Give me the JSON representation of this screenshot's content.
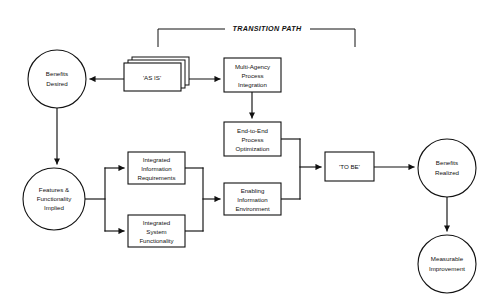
{
  "diagram": {
    "bracket": {
      "label": "TRANSITION PATH",
      "name": "transition-path-bracket"
    },
    "colors": {
      "stroke": "#111111",
      "fill": "#ffffff",
      "background": "#ffffff"
    },
    "nodes": [
      {
        "id": "benefits-desired",
        "shape": "circle",
        "lines": [
          "Benefits",
          "Desired"
        ],
        "cx": 57,
        "cy": 79,
        "r": 29
      },
      {
        "id": "as-is",
        "shape": "stacked-rectangle",
        "lines": [
          "'AS IS'"
        ],
        "x": 124,
        "y": 63,
        "w": 57,
        "h": 28
      },
      {
        "id": "multi-agency-process-integration",
        "shape": "rectangle",
        "lines": [
          "Multi-Agency",
          "Process",
          "Integration"
        ],
        "x": 224,
        "y": 58,
        "w": 57,
        "h": 34
      },
      {
        "id": "end-to-end-process-optimization",
        "shape": "rectangle",
        "lines": [
          "End-to-End",
          "Process",
          "Optimization"
        ],
        "x": 224,
        "y": 122,
        "w": 57,
        "h": 34
      },
      {
        "id": "features-functionality-implied",
        "shape": "circle",
        "lines": [
          "Features &",
          "Functionality",
          "Implied"
        ],
        "cx": 54,
        "cy": 199,
        "r": 31
      },
      {
        "id": "integrated-information-requirements",
        "shape": "rectangle",
        "lines": [
          "Integrated",
          "Information",
          "Requirements"
        ],
        "x": 128,
        "y": 152,
        "w": 57,
        "h": 32
      },
      {
        "id": "integrated-system-functionality",
        "shape": "rectangle",
        "lines": [
          "Integrated",
          "System",
          "Functionality"
        ],
        "x": 128,
        "y": 215,
        "w": 57,
        "h": 32
      },
      {
        "id": "enabling-information-environment",
        "shape": "rectangle",
        "lines": [
          "Enabling",
          "Information",
          "Environment"
        ],
        "x": 224,
        "y": 183,
        "w": 57,
        "h": 32
      },
      {
        "id": "to-be",
        "shape": "rectangle",
        "lines": [
          "'TO BE'"
        ],
        "x": 325,
        "y": 152,
        "w": 49,
        "h": 29
      },
      {
        "id": "benefits-realized",
        "shape": "circle",
        "lines": [
          "Benefits",
          "Realized"
        ],
        "cx": 447,
        "cy": 168,
        "r": 29
      },
      {
        "id": "measurable-improvement",
        "shape": "circle",
        "lines": [
          "Measurable",
          "Improvement"
        ],
        "cx": 447,
        "cy": 264,
        "r": 29
      }
    ],
    "edges": [
      {
        "id": "as-is-to-benefits-desired",
        "from": "as-is",
        "to": "benefits-desired",
        "arrow": true
      },
      {
        "id": "as-is-to-multi-agency",
        "from": "as-is",
        "to": "multi-agency-process-integration",
        "arrow": true
      },
      {
        "id": "benefits-desired-to-features",
        "from": "benefits-desired",
        "to": "features-functionality-implied",
        "arrow": true
      },
      {
        "id": "multi-agency-to-end-to-end",
        "from": "multi-agency-process-integration",
        "to": "end-to-end-process-optimization",
        "arrow": true
      },
      {
        "id": "features-to-integrated-information",
        "from": "features-functionality-implied",
        "to": "integrated-information-requirements",
        "arrow": true
      },
      {
        "id": "features-to-integrated-system",
        "from": "features-functionality-implied",
        "to": "integrated-system-functionality",
        "arrow": true
      },
      {
        "id": "integrated-boxes-to-enabling",
        "from": "integrated-information-requirements",
        "to": "enabling-information-environment",
        "arrow": true
      },
      {
        "id": "end-to-end-and-enabling-to-to-be",
        "from": "end-to-end-process-optimization",
        "to": "to-be",
        "arrow": true
      },
      {
        "id": "to-be-to-benefits-realized",
        "from": "to-be",
        "to": "benefits-realized",
        "arrow": true
      },
      {
        "id": "benefits-realized-to-measurable",
        "from": "benefits-realized",
        "to": "measurable-improvement",
        "arrow": true
      }
    ]
  }
}
